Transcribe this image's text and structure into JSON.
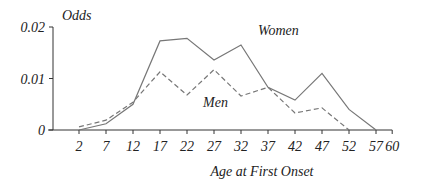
{
  "chart_data": {
    "type": "line",
    "title": "",
    "xlabel": "Age at First Onset",
    "ylabel": "Odds",
    "x": [
      2,
      7,
      12,
      17,
      22,
      27,
      32,
      37,
      42,
      47,
      52,
      57
    ],
    "x_ticks": [
      "2",
      "7",
      "12",
      "17",
      "22",
      "27",
      "32",
      "37",
      "42",
      "47",
      "52",
      "57",
      "60"
    ],
    "y_ticks": [
      "0",
      "0.01",
      "0.02"
    ],
    "ylim": [
      0,
      0.02
    ],
    "xlim": [
      2,
      60
    ],
    "grid": false,
    "legend_position": "inline labels",
    "series": [
      {
        "name": "Women",
        "style": "solid",
        "values": [
          0.0,
          0.0012,
          0.005,
          0.0173,
          0.0178,
          0.0136,
          0.0165,
          0.0083,
          0.0058,
          0.011,
          0.004,
          0.0
        ]
      },
      {
        "name": "Men",
        "style": "dashed",
        "values": [
          0.0006,
          0.0019,
          0.0054,
          0.0113,
          0.0068,
          0.0117,
          0.0066,
          0.0083,
          0.0033,
          0.0043,
          0.0,
          null
        ]
      }
    ],
    "annotations": [
      "Women",
      "Men"
    ]
  },
  "labels": {
    "ylabel": "Odds",
    "xlabel": "Age at First Onset",
    "women": "Women",
    "men": "Men"
  },
  "colors": {
    "line": "#777777",
    "axis": "#333333",
    "text": "#222222"
  }
}
